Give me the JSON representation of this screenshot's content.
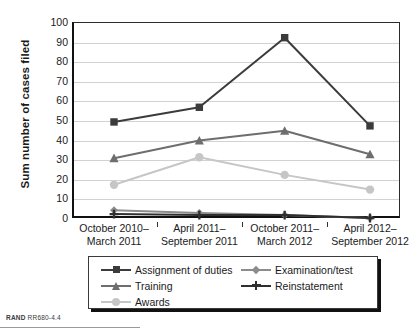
{
  "chart_data": {
    "type": "line",
    "title": "",
    "xlabel": "",
    "ylabel": "Sum number of cases filed",
    "ylim": [
      0,
      100
    ],
    "ytick_step": 10,
    "yticks": [
      100,
      90,
      80,
      70,
      60,
      50,
      40,
      30,
      20,
      10,
      0
    ],
    "grid": true,
    "legend_position": "bottom",
    "categories": [
      "October 2010–\nMarch 2011",
      "April 2011–\nSeptember 2011",
      "October 2011–\nMarch 2012",
      "April 2012–\nSeptember 2012"
    ],
    "series": [
      {
        "name": "Assignment of duties",
        "marker": "square",
        "color": "#3b3b3b",
        "values": [
          49,
          56.5,
          92,
          47
        ]
      },
      {
        "name": "Training",
        "marker": "triangle",
        "color": "#6e6e6e",
        "values": [
          30.5,
          39.5,
          44.5,
          32.5
        ]
      },
      {
        "name": "Awards",
        "marker": "circle",
        "color": "#c6c6c6",
        "values": [
          17,
          31,
          22,
          14.5
        ]
      },
      {
        "name": "Examination/test",
        "marker": "diamond",
        "color": "#8c8c8c",
        "values": [
          4,
          2.5,
          1.5,
          0
        ]
      },
      {
        "name": "Reinstatement",
        "marker": "plus",
        "color": "#2f2f2f",
        "values": [
          2,
          1.5,
          1.5,
          0
        ]
      }
    ]
  },
  "axis": {
    "y_title": "Sum number of cases filed",
    "y_ticks": [
      "100",
      "90",
      "80",
      "70",
      "60",
      "50",
      "40",
      "30",
      "20",
      "10",
      "0"
    ],
    "x_ticks": [
      {
        "line1": "October 2010–",
        "line2": "March 2011"
      },
      {
        "line1": "April 2011–",
        "line2": "September 2011"
      },
      {
        "line1": "October 2011–",
        "line2": "March 2012"
      },
      {
        "line1": "April 2012–",
        "line2": "September 2012"
      }
    ]
  },
  "legend": {
    "column_left": [
      {
        "label": "Assignment of duties",
        "marker": "square",
        "color": "#3b3b3b"
      },
      {
        "label": "Training",
        "marker": "triangle",
        "color": "#6e6e6e"
      },
      {
        "label": "Awards",
        "marker": "circle",
        "color": "#c6c6c6"
      }
    ],
    "column_right": [
      {
        "label": "Examination/test",
        "marker": "diamond",
        "color": "#8c8c8c"
      },
      {
        "label": "Reinstatement",
        "marker": "plus",
        "color": "#2f2f2f"
      }
    ]
  },
  "footer": {
    "source_prefix": "RAND",
    "source_id": "RR680-4.4"
  }
}
